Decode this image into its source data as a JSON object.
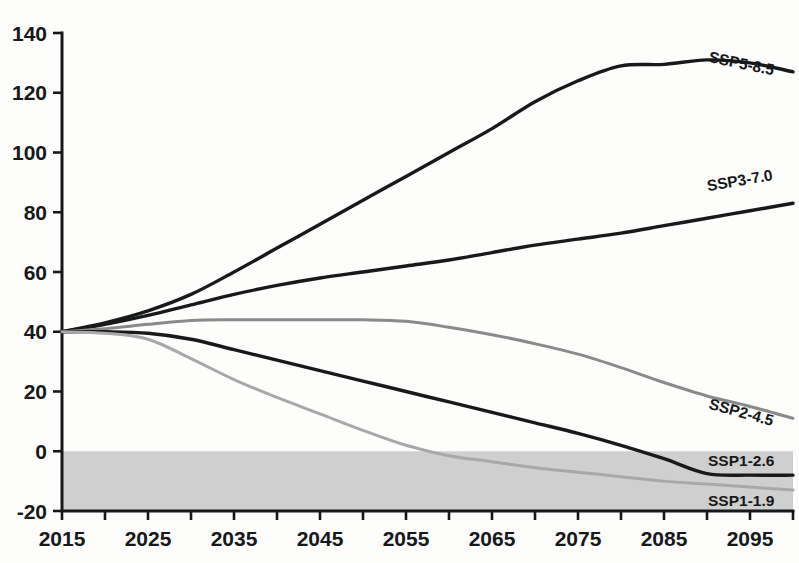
{
  "chart_data": {
    "type": "line",
    "title": "",
    "subtitle": "",
    "xlabel": "",
    "ylabel": "",
    "xlim": [
      2015,
      2100
    ],
    "ylim": [
      -20,
      140
    ],
    "grid": false,
    "legend_position": "inline-right-end-of-line",
    "x_tick_labels": [
      "2015",
      "2025",
      "2035",
      "2045",
      "2055",
      "2065",
      "2075",
      "2085",
      "2095"
    ],
    "x_tick_values": [
      2015,
      2025,
      2035,
      2045,
      2055,
      2065,
      2075,
      2085,
      2095
    ],
    "x_minor_tick_values": [
      2020,
      2030,
      2040,
      2050,
      2060,
      2070,
      2080,
      2090,
      2100
    ],
    "y_tick_labels": [
      "140",
      "120",
      "100",
      "80",
      "60",
      "40",
      "20",
      "0",
      "-20"
    ],
    "y_tick_values": [
      140,
      120,
      100,
      80,
      60,
      40,
      20,
      0,
      -20
    ],
    "annotations": [
      {
        "name": "negative-emissions-band",
        "y_from": 0,
        "y_to": -20,
        "color": "#cfcfcf"
      }
    ],
    "series": [
      {
        "name": "SSP5-8.5",
        "label": "SSP5-8.5",
        "color": "#17191b",
        "width": 3.4,
        "x": [
          2015,
          2020,
          2025,
          2030,
          2035,
          2040,
          2045,
          2050,
          2055,
          2060,
          2065,
          2070,
          2075,
          2080,
          2085,
          2090,
          2095,
          2100
        ],
        "values": [
          40.0,
          43.0,
          47.0,
          52.5,
          60.0,
          68.0,
          76.0,
          84.0,
          92.0,
          100.0,
          108.0,
          117.0,
          124.0,
          129.0,
          129.5,
          131.0,
          130.0,
          127.0
        ]
      },
      {
        "name": "SSP3-7.0",
        "label": "SSP3-7.0",
        "color": "#17191b",
        "width": 3.4,
        "x": [
          2015,
          2020,
          2025,
          2030,
          2035,
          2040,
          2045,
          2050,
          2055,
          2060,
          2065,
          2070,
          2075,
          2080,
          2085,
          2090,
          2095,
          2100
        ],
        "values": [
          40.0,
          42.5,
          45.5,
          49.0,
          52.5,
          55.5,
          58.0,
          60.0,
          62.0,
          64.0,
          66.5,
          69.0,
          71.0,
          73.0,
          75.5,
          78.0,
          80.5,
          83.0
        ]
      },
      {
        "name": "SSP2-4.5",
        "label": "SSP2-4.5",
        "color": "#8a8a8a",
        "width": 3.0,
        "x": [
          2015,
          2020,
          2025,
          2030,
          2035,
          2040,
          2045,
          2050,
          2055,
          2060,
          2065,
          2070,
          2075,
          2080,
          2085,
          2090,
          2095,
          2100
        ],
        "values": [
          40.0,
          41.0,
          42.5,
          43.8,
          44.0,
          44.0,
          44.0,
          44.0,
          43.5,
          41.5,
          39.0,
          36.0,
          32.5,
          28.0,
          23.0,
          18.5,
          15.0,
          11.0
        ]
      },
      {
        "name": "SSP1-2.6",
        "label": "SSP1-2.6",
        "color": "#17191b",
        "width": 3.4,
        "x": [
          2015,
          2020,
          2025,
          2030,
          2035,
          2040,
          2045,
          2050,
          2055,
          2060,
          2065,
          2070,
          2075,
          2080,
          2085,
          2090,
          2095,
          2100
        ],
        "values": [
          40.0,
          40.0,
          39.5,
          37.5,
          34.0,
          30.5,
          27.0,
          23.5,
          20.0,
          16.5,
          13.0,
          9.5,
          6.0,
          2.0,
          -2.5,
          -7.5,
          -8.0,
          -8.0
        ]
      },
      {
        "name": "SSP1-1.9",
        "label": "SSP1-1.9",
        "color": "#a8a8a8",
        "width": 3.0,
        "x": [
          2015,
          2020,
          2025,
          2030,
          2035,
          2040,
          2045,
          2050,
          2055,
          2060,
          2065,
          2070,
          2075,
          2080,
          2085,
          2090,
          2095,
          2100
        ],
        "values": [
          40.0,
          39.5,
          37.5,
          31.0,
          24.0,
          18.0,
          12.5,
          7.0,
          2.0,
          -1.5,
          -3.5,
          -5.5,
          -7.0,
          -8.5,
          -10.0,
          -11.0,
          -12.0,
          -13.0
        ]
      }
    ]
  },
  "axes": {
    "y_tick_0": "140",
    "y_tick_1": "120",
    "y_tick_2": "100",
    "y_tick_3": "80",
    "y_tick_4": "60",
    "y_tick_5": "40",
    "y_tick_6": "20",
    "y_tick_7": "0",
    "y_tick_8": "-20"
  },
  "colors": {
    "background": "#fdfdfc",
    "axis": "#16181a",
    "negative_band": "#cfcfcf",
    "dark_series": "#17191b",
    "mid_gray_series": "#8a8a8a",
    "light_gray_series": "#a8a8a8"
  }
}
